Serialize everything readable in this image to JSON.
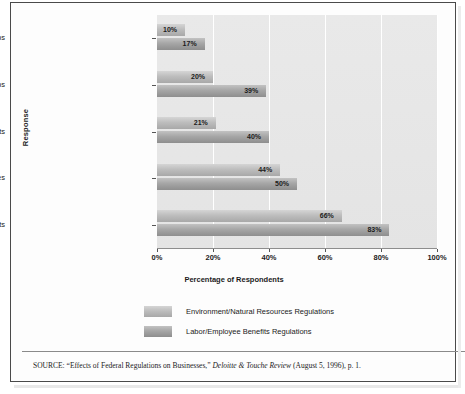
{
  "chart_data": {
    "type": "bar",
    "orientation": "horizontal",
    "title": "",
    "xlabel": "Percentage of Respondents",
    "ylabel": "Response",
    "xlim": [
      0,
      100
    ],
    "xticks": [
      "0%",
      "20%",
      "40%",
      "60%",
      "80%",
      "100%"
    ],
    "xtick_values": [
      0,
      20,
      40,
      60,
      80,
      100
    ],
    "grid": "vertical-white",
    "legend_position": "below-bottom-center",
    "categories": [
      "Elimination of jobs",
      "Failure to add new jobs",
      "Lower employee benefits",
      "Higher prices",
      "Reduced profits"
    ],
    "series": [
      {
        "name": "Environment/Natural Resources Regulations",
        "color": "#bdbdbd",
        "values": [
          10,
          20,
          21,
          44,
          66
        ],
        "labels": [
          "10%",
          "20%",
          "21%",
          "44%",
          "66%"
        ]
      },
      {
        "name": "Labor/Employee Benefits Regulations",
        "color": "#a6a6a6",
        "values": [
          17,
          39,
          40,
          50,
          83
        ],
        "labels": [
          "17%",
          "39%",
          "40%",
          "50%",
          "83%"
        ]
      }
    ]
  },
  "legend": {
    "items": [
      {
        "label": "Environment/Natural Resources Regulations"
      },
      {
        "label": "Labor/Employee Benefits Regulations"
      }
    ]
  },
  "source": {
    "prefix": "SOURCE: “Effects of Federal Regulations on Businesses,” ",
    "italic": "Deloitte & Touche Review",
    "suffix": " (August 5, 1996), p. 1."
  }
}
